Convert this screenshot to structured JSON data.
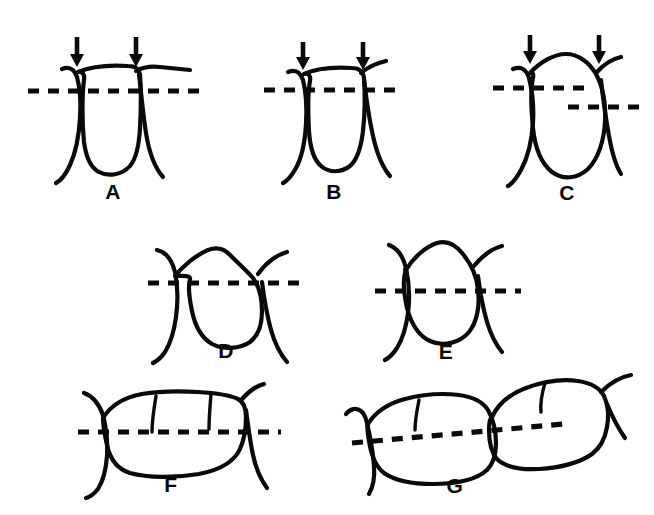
{
  "figure": {
    "background_color": "#ffffff",
    "ink_color": "#0a0a0a",
    "panel_count": 7,
    "rows": 3
  },
  "panels": [
    {
      "id": "A",
      "label": "A",
      "label_x": 113,
      "label_y": 199,
      "tooth_type": "flat-topped square tooth with broad flat contact",
      "arrow_count": 2,
      "dashed_line_count": 1,
      "dashed_lines": "single level horizontal reference line",
      "arrows": [
        {
          "name": "contact-arrow-left",
          "x": 77,
          "y_top": 37,
          "y_bottom": 66
        },
        {
          "name": "contact-arrow-right",
          "x": 136,
          "y_top": 37,
          "y_bottom": 66
        }
      ]
    },
    {
      "id": "B",
      "label": "B",
      "label_x": 334,
      "label_y": 199,
      "tooth_type": "narrow flat-topped tooth with slight convex crest",
      "arrow_count": 2,
      "dashed_line_count": 1,
      "dashed_lines": "single level horizontal reference line",
      "arrows": [
        {
          "name": "contact-arrow-left",
          "x": 303,
          "y_top": 42,
          "y_bottom": 70
        },
        {
          "name": "contact-arrow-right",
          "x": 363,
          "y_top": 42,
          "y_bottom": 70
        }
      ]
    },
    {
      "id": "C",
      "label": "C",
      "label_x": 567,
      "label_y": 200,
      "tooth_type": "rounded convex tooth, contacts at two different heights",
      "arrow_count": 2,
      "dashed_line_count": 2,
      "dashed_lines": "two offset horizontal reference lines at different levels",
      "arrows": [
        {
          "name": "contact-arrow-left",
          "x": 530,
          "y_top": 35,
          "y_bottom": 64
        },
        {
          "name": "contact-arrow-right",
          "x": 599,
          "y_top": 35,
          "y_bottom": 64
        }
      ]
    },
    {
      "id": "D",
      "label": "D",
      "label_x": 226,
      "label_y": 358,
      "tooth_type": "pointed-crest tooth with angular occlusal outline",
      "arrow_count": 0,
      "dashed_line_count": 1,
      "dashed_lines": "single level horizontal reference line"
    },
    {
      "id": "E",
      "label": "E",
      "label_x": 446,
      "label_y": 359,
      "tooth_type": "rounded oval tooth outline",
      "arrow_count": 0,
      "dashed_line_count": 1,
      "dashed_lines": "single level horizontal reference line"
    },
    {
      "id": "F",
      "label": "F",
      "label_x": 171,
      "label_y": 492,
      "tooth_type": "molar in buccal view with three cusps and two grooves",
      "arrow_count": 0,
      "dashed_line_count": 1,
      "dashed_lines": "single level horizontal reference line"
    },
    {
      "id": "G",
      "label": "G",
      "label_x": 455,
      "label_y": 493,
      "tooth_type": "two adjacent tilted molars with stepped contact",
      "arrow_count": 0,
      "dashed_line_count": 1,
      "dashed_lines": "single inclined reference line following the tilted arch"
    }
  ]
}
